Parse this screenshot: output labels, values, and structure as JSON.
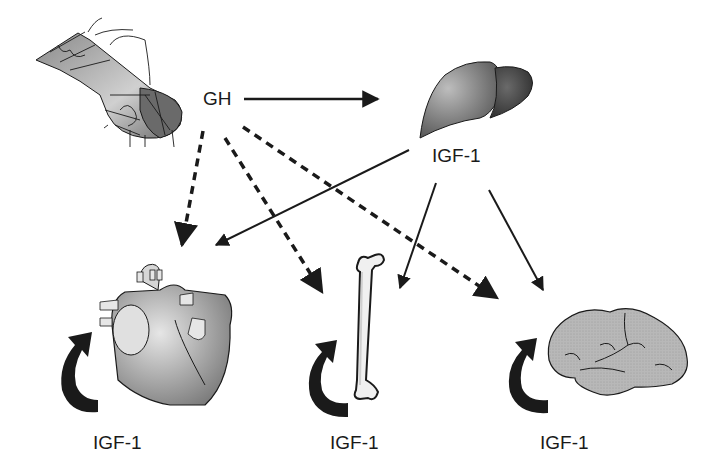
{
  "labels": {
    "gh": "GH",
    "liver_igf": "IGF-1",
    "heart_igf": "IGF-1",
    "bone_igf": "IGF-1",
    "brain_igf": "IGF-1"
  },
  "nodes": [
    {
      "id": "pituitary",
      "label": "Pituitary gland"
    },
    {
      "id": "liver",
      "label": "Liver"
    },
    {
      "id": "heart",
      "label": "Heart"
    },
    {
      "id": "bone",
      "label": "Bone"
    },
    {
      "id": "brain",
      "label": "Brain"
    }
  ],
  "edges": [
    {
      "from": "pituitary",
      "to": "liver",
      "label": "GH",
      "style": "solid"
    },
    {
      "from": "pituitary",
      "to": "heart",
      "label": "GH",
      "style": "dashed"
    },
    {
      "from": "pituitary",
      "to": "bone",
      "label": "GH",
      "style": "dashed"
    },
    {
      "from": "pituitary",
      "to": "brain",
      "label": "GH",
      "style": "dashed"
    },
    {
      "from": "liver",
      "to": "heart",
      "label": "IGF-1",
      "style": "solid"
    },
    {
      "from": "liver",
      "to": "bone",
      "label": "IGF-1",
      "style": "solid"
    },
    {
      "from": "liver",
      "to": "brain",
      "label": "IGF-1",
      "style": "solid"
    },
    {
      "from": "heart",
      "to": "heart",
      "label": "IGF-1",
      "style": "autocrine-loop"
    },
    {
      "from": "bone",
      "to": "bone",
      "label": "IGF-1",
      "style": "autocrine-loop"
    },
    {
      "from": "brain",
      "to": "brain",
      "label": "IGF-1",
      "style": "autocrine-loop"
    }
  ],
  "colors": {
    "ink": "#1a1a1a",
    "organ_light": "#d9d9d9",
    "organ_mid": "#9a9a9a",
    "organ_dark": "#4a4a4a"
  }
}
